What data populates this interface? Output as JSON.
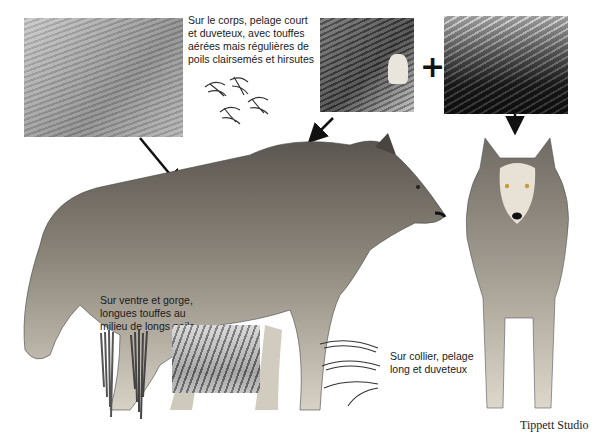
{
  "annotations": {
    "body_fur": "Sur le corps, pelage court\net duveteux, avec touffes\naérées mais régulières de\npoils clairsemés et hirsutes",
    "belly_fur": "Sur ventre et gorge,\nlongues touffes au\nmilieu de longs poils",
    "collar_fur": "Sur collier, pelage\nlong et duveteux"
  },
  "symbols": {
    "plus": "+"
  },
  "credit": "Tippett Studio",
  "insets": [
    {
      "name": "body-fur-closeup",
      "description": "light grey short fur texture"
    },
    {
      "name": "neck-ear-closeup",
      "description": "wolf neck fur with ear"
    },
    {
      "name": "mane-closeup",
      "description": "dark mane fur highlight"
    },
    {
      "name": "belly-fur-closeup",
      "description": "long belly fur tufts"
    }
  ],
  "subjects": [
    {
      "name": "wolf-side-view",
      "description": "grey wolf standing, profile facing right"
    },
    {
      "name": "wolf-front-view",
      "description": "grey wolf standing, facing viewer"
    }
  ],
  "colors": {
    "text": "#1a1a1a",
    "background": "#ffffff",
    "arrow": "#111111"
  }
}
